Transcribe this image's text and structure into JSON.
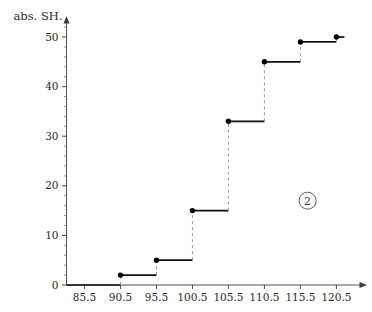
{
  "chart_data": {
    "type": "line",
    "subtype": "step",
    "title": "",
    "xlabel": "",
    "ylabel": "abs. SH.",
    "x": [
      90.5,
      95.5,
      100.5,
      105.5,
      110.5,
      115.5,
      120.5
    ],
    "values": [
      2,
      5,
      15,
      33,
      45,
      49,
      50
    ],
    "points": [
      {
        "x": 90.5,
        "y": 2
      },
      {
        "x": 95.5,
        "y": 5
      },
      {
        "x": 100.5,
        "y": 15
      },
      {
        "x": 105.5,
        "y": 33
      },
      {
        "x": 110.5,
        "y": 45
      },
      {
        "x": 115.5,
        "y": 49
      },
      {
        "x": 120.5,
        "y": 50
      }
    ],
    "xlim": [
      83.0,
      123.5
    ],
    "ylim": [
      0,
      52
    ],
    "xticks": [
      85.5,
      90.5,
      95.5,
      100.5,
      105.5,
      110.5,
      115.5,
      120.5
    ],
    "xtick_labels": [
      "85.5",
      "90.5",
      "95.5",
      "100.5",
      "105.5",
      "110.5",
      "115.5",
      "120.5"
    ],
    "yticks": [
      0,
      10,
      20,
      30,
      40,
      50
    ],
    "ytick_labels": [
      "0",
      "10",
      "20",
      "30",
      "40",
      "50"
    ],
    "y_minor_step": 2,
    "grid": false,
    "legend": null,
    "step_mode": "post",
    "markers": "filled-circle",
    "riser_style": "dashed",
    "annotations": [
      {
        "text": "2",
        "shape": "circled",
        "x": 116.5,
        "y": 17
      }
    ]
  },
  "axes": {
    "y_title": "abs. SH.",
    "x_title": "",
    "arrow_x": true,
    "arrow_y": true
  }
}
